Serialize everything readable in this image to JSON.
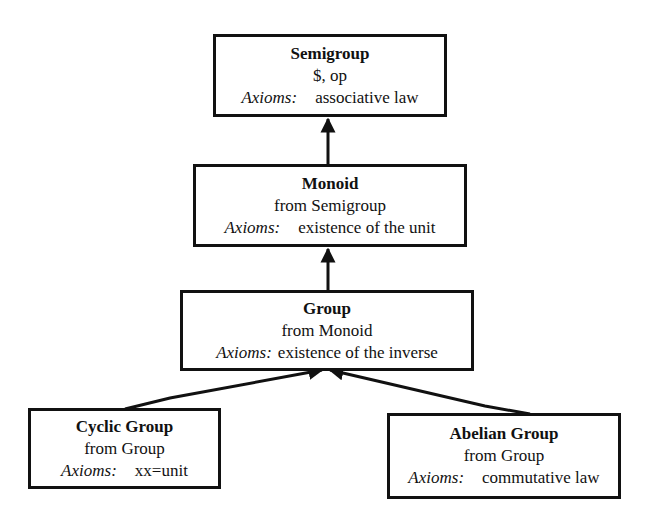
{
  "diagram": {
    "type": "inheritance-hierarchy",
    "axioms_label": "Axioms:",
    "nodes": [
      {
        "id": "semigroup",
        "name": "Semigroup",
        "sub": "$, op",
        "axiom": "associative law"
      },
      {
        "id": "monoid",
        "name": "Monoid",
        "sub": "from Semigroup",
        "axiom": "existence of the unit"
      },
      {
        "id": "group",
        "name": "Group",
        "sub": "from Monoid",
        "axiom": "existence of the inverse"
      },
      {
        "id": "cyclic",
        "name": "Cyclic Group",
        "sub": "from Group",
        "axiom": "xx=unit"
      },
      {
        "id": "abelian",
        "name": "Abelian Group",
        "sub": "from Group",
        "axiom": "commutative law"
      }
    ],
    "edges": [
      {
        "from": "monoid",
        "to": "semigroup"
      },
      {
        "from": "group",
        "to": "monoid"
      },
      {
        "from": "cyclic",
        "to": "group"
      },
      {
        "from": "abelian",
        "to": "group"
      }
    ]
  }
}
